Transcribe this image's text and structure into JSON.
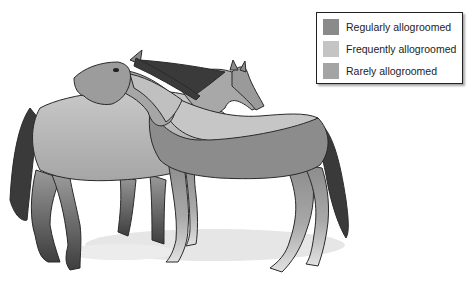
{
  "legend": {
    "items": [
      {
        "label": "Regularly allogroomed",
        "color": "#8a8a8a"
      },
      {
        "label": "Frequently allogroomed",
        "color": "#c4c4c4"
      },
      {
        "label": "Rarely allogroomed",
        "color": "#a4a4a4"
      }
    ]
  },
  "colors": {
    "regular": "#8a8a8a",
    "frequent": "#c4c4c4",
    "rare": "#a4a4a4",
    "mane_tail": "#3a3a3a",
    "shadow": "#e4e4e4",
    "outline": "#2a2a2a"
  }
}
